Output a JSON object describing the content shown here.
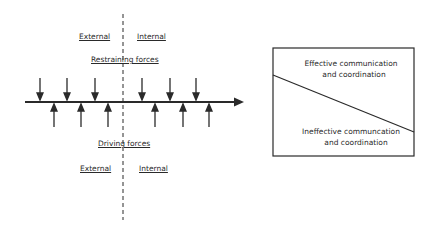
{
  "force_field": {
    "top": {
      "external_label": "External",
      "internal_label": "Internal",
      "forces_label": "Restraining forces"
    },
    "bottom": {
      "forces_label": "Driving forces",
      "external_label": "External",
      "internal_label": "Internal"
    },
    "restraining_arrows_count": 6,
    "driving_arrows_count": 6
  },
  "continuum_box": {
    "top_label_line1": "Effective communication",
    "top_label_line2": "and coordination",
    "bottom_label_line1": "Ineffective communcation",
    "bottom_label_line2": "and coordination"
  },
  "colors": {
    "ink": "#2a2a2a",
    "background": "#ffffff"
  }
}
